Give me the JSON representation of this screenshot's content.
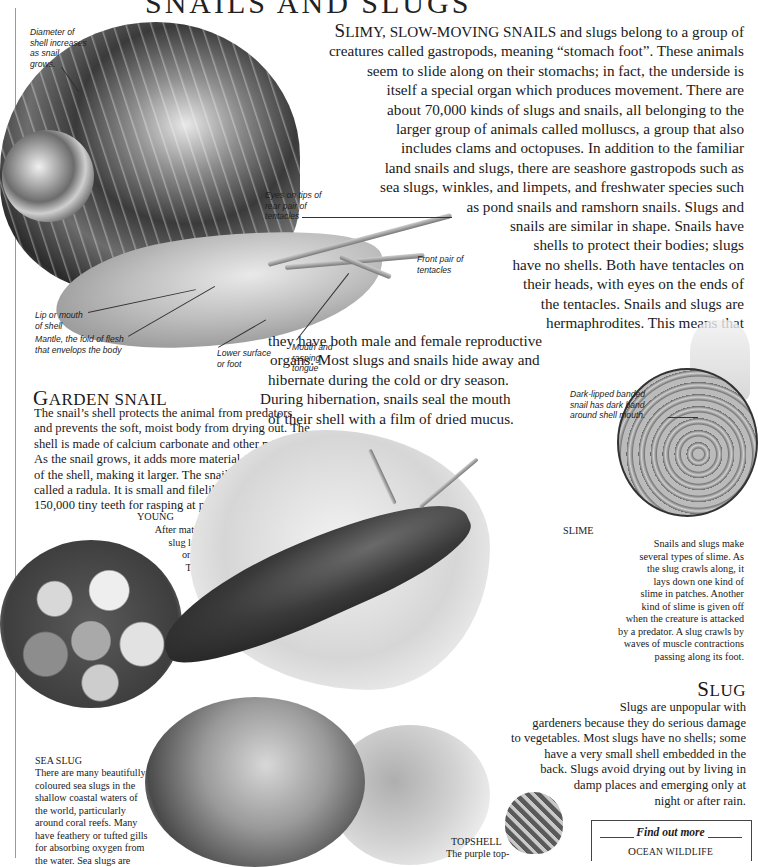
{
  "page": {
    "title": "SNAILS AND SLUGS"
  },
  "intro": {
    "lead_big": "S",
    "lead_rest": "LIMY, SLOW-MOVING SNAILS",
    "lines": [
      " and slugs belong to a group of",
      "creatures called gastropods, meaning “stomach foot”. These animals",
      "seem to slide along on their stomachs; in fact, the underside is",
      "itself a special organ which produces movement. There are",
      "about 70,000 kinds of slugs and snails, all belonging to the",
      "larger group of animals called molluscs, a group that also",
      "includes clams and octopuses. In addition to the familiar",
      "land snails and slugs, there are seashore gastropods such as",
      "sea slugs, winkles, and limpets, and freshwater species such",
      "as pond snails and ramshorn snails. Slugs and",
      "snails are similar in shape. Snails have",
      "shells to protect their bodies; slugs",
      "have no shells. Both have tentacles on",
      "their heads, with eyes on the ends of",
      "the tentacles. Snails and slugs are",
      "hermaphrodites. This means that",
      "they have both male and female reproductive",
      "organs. Most slugs and snails hide away and",
      "hibernate during the cold or dry season.",
      "During hibernation, snails seal the mouth",
      "of their shell with a film of dried mucus."
    ]
  },
  "captions": {
    "diameter": [
      "Diameter of",
      "shell increases",
      "as snail",
      "grows."
    ],
    "eyes": [
      "Eyes on tips of",
      "rear pair of",
      "tentacles"
    ],
    "front_pair": [
      "Front pair of",
      "tentacles"
    ],
    "lip": [
      "Lip or mouth",
      "of shell"
    ],
    "mantle": [
      "Mantle, the fold of flesh",
      "that envelops the body"
    ],
    "lower_surface": [
      "Lower surface",
      "or foot"
    ],
    "mouth": [
      "Mouth and",
      "rasping",
      "tongue"
    ],
    "dark_lipped": [
      "Dark-lipped banded",
      "snail has dark band",
      "around shell mouth."
    ]
  },
  "garden_snail": {
    "heading_big": "G",
    "heading_rest": "ARDEN SNAIL",
    "lines": [
      "The snail’s shell protects the animal from predators",
      "and prevents the soft, moist body from drying out. The",
      "shell is made of calcium carbonate and other minerals.",
      "As the snail grows, it adds more material to the mouth",
      "of the shell, making it larger. The snail’s tongue is",
      "called a radula. It is small and filelike, with as many as",
      "150,000 tiny teeth for rasping at plant food."
    ]
  },
  "young": {
    "heading": "YOUNG",
    "lines": [
      "After mating, the snail or",
      "slug lays eggs, either singly",
      "or in batches in mucus.",
      "The young snails and",
      "slugs hatch from",
      "their eggs after",
      "about two to",
      "four weeks."
    ]
  },
  "slime": {
    "heading": "SLIME",
    "lines": [
      "Snails and slugs make",
      "several types of slime. As",
      "the slug crawls along, it",
      "lays down one kind of",
      "slime in patches. Another",
      "kind of slime is given off",
      "when the creature is attacked",
      "by a predator. A slug crawls by",
      "waves of muscle contractions",
      "passing along its foot."
    ]
  },
  "slug": {
    "heading_big": "S",
    "heading_rest": "LUG",
    "lines": [
      "Slugs are unpopular with",
      "gardeners because they do serious damage",
      "to vegetables. Most slugs have no shells; some",
      "have a very small shell embedded in the",
      "back. Slugs avoid drying out by living in",
      "damp places and emerging only at",
      "night or after rain."
    ]
  },
  "sea_slug": {
    "heading": "SEA SLUG",
    "lines": [
      "There are many beautifully",
      "coloured sea slugs in the",
      "shallow coastal waters of",
      "the world, particularly",
      "around coral reefs. Many",
      "have feathery or tufted gills",
      "for absorbing oxygen from",
      "the water. Sea slugs are"
    ]
  },
  "topshell": {
    "heading": "TOPSHELL",
    "lines": [
      "The purple top-"
    ]
  },
  "find_out_more": {
    "heading": "Find out more",
    "links": [
      {
        "big": "O",
        "rest": "CEAN WILDLIFE"
      }
    ]
  }
}
